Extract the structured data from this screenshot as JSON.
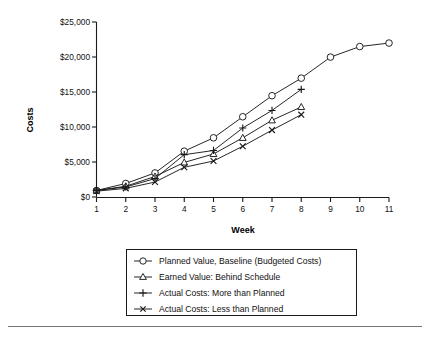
{
  "chart_data": {
    "type": "line",
    "title": "",
    "xlabel": "Week",
    "ylabel": "Costs",
    "x": [
      1,
      2,
      3,
      4,
      5,
      6,
      7,
      8,
      9,
      10,
      11
    ],
    "xlim": [
      1,
      11
    ],
    "ylim": [
      0,
      25000
    ],
    "xtick_labels": [
      "1",
      "2",
      "3",
      "4",
      "5",
      "6",
      "7",
      "8",
      "9",
      "10",
      "11"
    ],
    "ytick_labels": [
      "$0",
      "$5,000",
      "$10,000",
      "$15,000",
      "$20,000",
      "$25,000"
    ],
    "ytick_values": [
      0,
      5000,
      10000,
      15000,
      20000,
      25000
    ],
    "grid": false,
    "legend_position": "below-center",
    "series": [
      {
        "name": "Planned Value, Baseline (Budgeted Costs)",
        "marker": "circle",
        "x": [
          1,
          2,
          3,
          4,
          5,
          6,
          7,
          8,
          9,
          10,
          11
        ],
        "values": [
          1000,
          2000,
          3500,
          6600,
          8500,
          11500,
          14500,
          17000,
          20000,
          21500,
          22000
        ]
      },
      {
        "name": "Earned Value: Behind Schedule",
        "marker": "triangle",
        "x": [
          1,
          2,
          3,
          4,
          5,
          6,
          7,
          8
        ],
        "values": [
          1000,
          1600,
          3000,
          5000,
          6200,
          8500,
          11000,
          12900
        ]
      },
      {
        "name": "Actual Costs: More than Planned",
        "marker": "plus",
        "x": [
          1,
          2,
          3,
          4,
          5,
          6,
          7,
          8
        ],
        "values": [
          1000,
          1500,
          2700,
          6100,
          6700,
          9900,
          12400,
          15400
        ]
      },
      {
        "name": "Actual Costs: Less than Planned",
        "marker": "cross",
        "x": [
          1,
          2,
          3,
          4,
          5,
          6,
          7,
          8
        ],
        "values": [
          900,
          1300,
          2200,
          4300,
          5200,
          7300,
          9600,
          11800
        ]
      }
    ]
  },
  "legend": {
    "entries": [
      {
        "label": "Planned Value, Baseline (Budgeted Costs)",
        "marker": "circle"
      },
      {
        "label": "Earned Value: Behind Schedule",
        "marker": "triangle"
      },
      {
        "label": "Actual Costs: More than Planned",
        "marker": "plus"
      },
      {
        "label": "Actual Costs: Less than Planned",
        "marker": "cross"
      }
    ]
  },
  "axes": {
    "y_title": "Costs",
    "x_title": "Week",
    "y_ticks": [
      "$25,000",
      "$20,000",
      "$15,000",
      "$10,000",
      "$5,000",
      "$0"
    ],
    "x_ticks": [
      "1",
      "2",
      "3",
      "4",
      "5",
      "6",
      "7",
      "8",
      "9",
      "10",
      "11"
    ]
  },
  "colors": {
    "ink": "#1a1a1a",
    "background": "#ffffff",
    "rule": "#666666"
  }
}
